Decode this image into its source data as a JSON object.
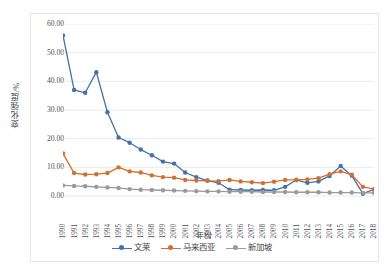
{
  "chart_data": {
    "type": "line",
    "title": "",
    "xlabel": "年份",
    "ylabel": "变化强度/%",
    "ylim": [
      0,
      60
    ],
    "ytick_labels": [
      "0.00",
      "10.00",
      "20.00",
      "30.00",
      "40.00",
      "50.00",
      "60.00"
    ],
    "ytick_values": [
      0,
      10,
      20,
      30,
      40,
      50,
      60
    ],
    "grid": "horizontal",
    "legend_position": "bottom",
    "categories": [
      "1990",
      "1991",
      "1992",
      "1993",
      "1994",
      "1995",
      "1996",
      "1997",
      "1998",
      "1999",
      "2000",
      "2001",
      "2002",
      "2003",
      "2004",
      "2005",
      "2006",
      "2007",
      "2008",
      "2009",
      "2010",
      "2011",
      "2012",
      "2013",
      "2014",
      "2015",
      "2016",
      "2017",
      "2018"
    ],
    "series": [
      {
        "name": "文莱",
        "color": "#4472a8",
        "values": [
          56.0,
          37.0,
          36.0,
          43.2,
          29.2,
          20.4,
          18.6,
          16.2,
          14.2,
          12.0,
          11.3,
          8.2,
          6.6,
          5.4,
          4.6,
          2.2,
          2.1,
          2.0,
          2.1,
          2.0,
          3.2,
          5.6,
          4.6,
          5.1,
          7.0,
          10.5,
          7.1,
          0.8,
          2.3
        ]
      },
      {
        "name": "马来西亚",
        "color": "#d2712f",
        "values": [
          14.8,
          8.0,
          7.5,
          7.6,
          8.0,
          10.0,
          8.6,
          8.2,
          7.2,
          6.6,
          6.4,
          5.6,
          5.4,
          5.3,
          5.2,
          5.6,
          5.1,
          4.8,
          4.5,
          5.0,
          5.6,
          5.6,
          5.8,
          6.2,
          7.6,
          8.6,
          7.4,
          3.2,
          2.4
        ]
      },
      {
        "name": "新加坡",
        "color": "#9a9a9a",
        "values": [
          3.7,
          3.5,
          3.4,
          3.2,
          3.0,
          2.8,
          2.4,
          2.2,
          2.1,
          2.0,
          1.9,
          1.8,
          1.7,
          1.6,
          1.6,
          1.5,
          1.5,
          1.5,
          1.4,
          1.4,
          1.4,
          1.3,
          1.3,
          1.3,
          1.2,
          1.2,
          1.2,
          1.1,
          1.1
        ]
      }
    ]
  },
  "legend": {
    "items": [
      {
        "label": "文莱"
      },
      {
        "label": "马来西亚"
      },
      {
        "label": "新加坡"
      }
    ]
  },
  "axes": {
    "y_title": "变化强度/%",
    "x_title": "年份"
  }
}
